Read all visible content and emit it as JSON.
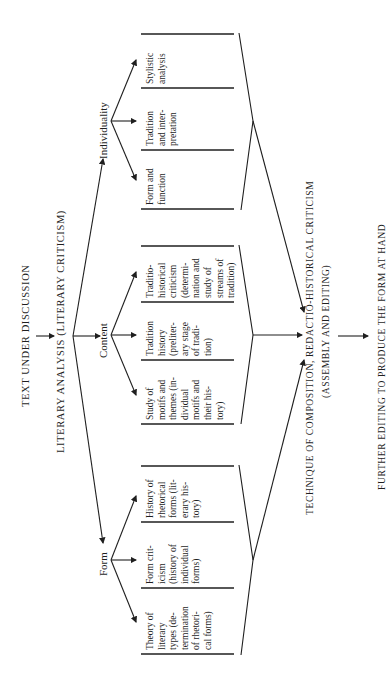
{
  "title": "Text under discussion",
  "nodes": {
    "text_under_discussion": "TEXT UNDER DISCUSSION",
    "literary_analysis": "LITERARY ANALYSIS (LITERARY CRITICISM)",
    "technique_line1": "TECHNIQUE OF COMPOSITION, REDACTIO-HISTORICAL CRITICISM",
    "technique_line2": "(ASSEMBLY AND EDITING)",
    "further_editing": "FURTHER EDITING TO PRODUCE THE FORM AT HAND"
  },
  "branches": [
    {
      "label": "Individuality",
      "cells": [
        "Stylistic\nanalysis",
        "Tradition\nand inter-\npretation",
        "Form and\nfunction"
      ]
    },
    {
      "label": "Content",
      "cells": [
        "Traditio-\nhistorical\ncriticism\n(determi-\nnation and\nstudy of\nstreams of\ntradition)",
        "Tradition\nhistory\n(preliter-\nary stage\nof tradi-\ntion)",
        "Study of\nmotifs and\nthemes (in-\ndividual\nmotifs and\ntheir his-\ntory)"
      ]
    },
    {
      "label": "Form",
      "cells": [
        "History of\nrhetorical\nforms (lit-\nerary his-\ntory)",
        "Form crit-\nicism\n(history of\nindividual\nforms)",
        "Theory of\nliterary\ntypes (de-\ntermination\nof rhetori-\ncal forms)"
      ]
    }
  ]
}
